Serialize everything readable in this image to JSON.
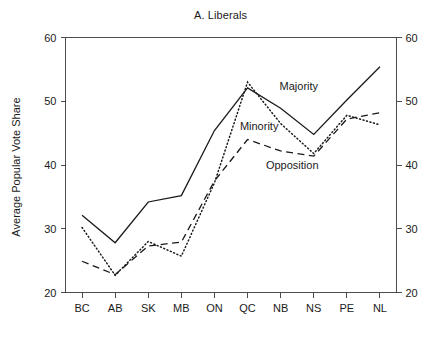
{
  "chart_data": {
    "type": "line",
    "title": "A. Liberals",
    "xlabel": "",
    "ylabel": "Average Popular Vote Share",
    "categories": [
      "BC",
      "AB",
      "SK",
      "MB",
      "ON",
      "QC",
      "NB",
      "NS",
      "PE",
      "NL"
    ],
    "ylim": [
      20,
      60
    ],
    "yticks": [
      20,
      30,
      40,
      50,
      60
    ],
    "ytick_labels": [
      "20",
      "30",
      "40",
      "50",
      "60"
    ],
    "grid": false,
    "legend_position": "inline-annotations",
    "axes": {
      "left_axis": true,
      "right_axis": true,
      "right_axis_labels": [
        "20",
        "30",
        "40",
        "50",
        "60"
      ]
    },
    "series": [
      {
        "name": "Majority",
        "style": "solid",
        "color": "#1a1a1a",
        "values": [
          32.1,
          27.8,
          34.2,
          35.2,
          45.4,
          52.1,
          48.9,
          44.8,
          50.2,
          55.4
        ],
        "annotation": {
          "text": "Majority",
          "x": 6.55,
          "y": 51.8
        }
      },
      {
        "name": "Minority",
        "style": "dotted",
        "color": "#1a1a1a",
        "values": [
          30.2,
          22.7,
          28.0,
          25.7,
          37.2,
          53.0,
          46.5,
          41.8,
          47.8,
          46.3
        ],
        "annotation": {
          "text": "Minority",
          "x": 5.35,
          "y": 45.5
        }
      },
      {
        "name": "Opposition",
        "style": "dashed",
        "color": "#1a1a1a",
        "values": [
          24.9,
          22.8,
          27.3,
          27.9,
          37.5,
          44.0,
          42.2,
          41.4,
          47.2,
          48.2
        ],
        "annotation": {
          "text": "Opposition",
          "x": 6.35,
          "y": 39.4
        }
      }
    ]
  },
  "annotations": {
    "majority": "Majority",
    "minority": "Minority",
    "opposition": "Opposition"
  }
}
